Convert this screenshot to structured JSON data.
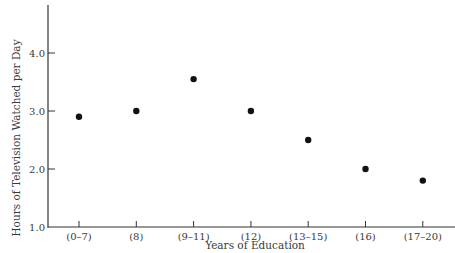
{
  "chart_data": {
    "type": "scatter",
    "title": "",
    "xlabel": "Years of Education",
    "ylabel": "Hours of Television Watched per Day",
    "categories": [
      "(0–7)",
      "(8)",
      "(9–11)",
      "(12)",
      "(13–15)",
      "(16)",
      "(17–20)"
    ],
    "values": [
      2.9,
      3.0,
      3.55,
      3.0,
      2.5,
      2.0,
      1.8
    ],
    "ylim": [
      1.0,
      4.8
    ],
    "yticks": [
      1.0,
      2.0,
      3.0,
      4.0
    ],
    "ytick_labels": [
      "1.0",
      "2.0",
      "3.0",
      "4.0"
    ],
    "grid": false,
    "legend": null,
    "marker_color": "#111111",
    "axis_color": "#333333"
  }
}
